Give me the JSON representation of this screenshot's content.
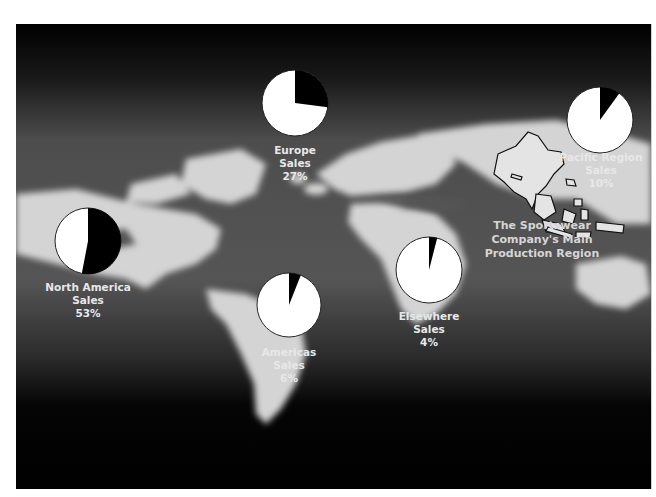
{
  "header": {
    "title": ""
  },
  "chart_data": {
    "type": "pie",
    "title": "",
    "subtitle": "",
    "background": "world map (grayscale photo)",
    "series": [
      {
        "name": "North America Sales",
        "region": "North America",
        "value": 53,
        "unit": "%"
      },
      {
        "name": "Europe Sales",
        "region": "Europe",
        "value": 27,
        "unit": "%"
      },
      {
        "name": "Pacific Region Sales",
        "region": "Pacific Region",
        "value": 10,
        "unit": "%"
      },
      {
        "name": "Americas Sales",
        "region": "Americas",
        "value": 6,
        "unit": "%"
      },
      {
        "name": "Elsewhere Sales",
        "region": "Elsewhere",
        "value": 4,
        "unit": "%"
      }
    ],
    "annotations": [
      "The Sportswear Company's Main Production Region"
    ],
    "slice_colors": {
      "share": "#000000",
      "remainder": "#ffffff"
    }
  },
  "pies": {
    "north_america": {
      "line1": "North America",
      "line2": "Sales",
      "pct": "53%",
      "value": 53
    },
    "europe": {
      "line1": "Europe",
      "line2": "Sales",
      "pct": "27%",
      "value": 27
    },
    "pacific": {
      "line1": "Pacific Region",
      "line2": "Sales",
      "pct": "10%",
      "value": 10
    },
    "americas": {
      "line1": "Americas",
      "line2": "Sales",
      "pct": "6%",
      "value": 6
    },
    "elsewhere": {
      "line1": "Elsewhere",
      "line2": "Sales",
      "pct": "4%",
      "value": 4
    }
  },
  "annotation": {
    "line1": "The Sportswear",
    "line2": "Company's Main",
    "line3": "Production Region"
  },
  "colors": {
    "panel_bg": "#000000",
    "land": "#d9d9d9",
    "ocean": "#4a4a4a",
    "label_text": "#e8e8e8"
  }
}
